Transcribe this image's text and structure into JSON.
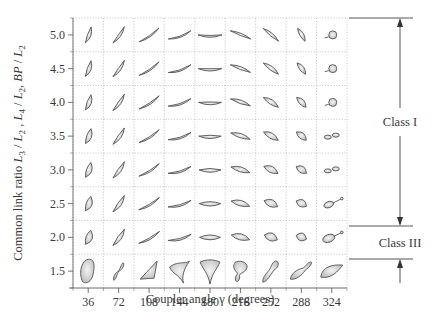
{
  "figure": {
    "x_axis_label": "Coupler angle γ (degrees)",
    "y_axis_label_parts": [
      "Common link ratio ",
      "L",
      "3",
      " / ",
      "L",
      "2",
      " , ",
      "L",
      "4",
      " / ",
      "L",
      "2",
      ", ",
      "BP",
      " / ",
      "L",
      "2"
    ],
    "x_ticks": [
      "36",
      "72",
      "108",
      "144",
      "180",
      "216",
      "252",
      "288",
      "324"
    ],
    "y_ticks": [
      "5.0",
      "4.5",
      "4.0",
      "3.5",
      "3.0",
      "2.5",
      "2.0",
      "1.5"
    ],
    "classes": [
      {
        "label": "Class I",
        "rows": [
          "5.0",
          "2.0"
        ]
      },
      {
        "label": "Class III",
        "rows": [
          "1.5"
        ]
      }
    ],
    "cell_description": "Each cell shows the coupler curve shape for the given coupler angle (column) and common link ratio (row)."
  }
}
